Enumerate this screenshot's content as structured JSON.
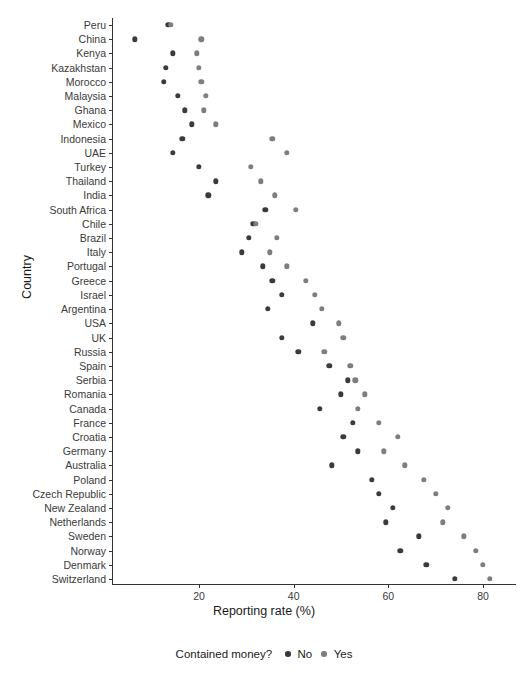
{
  "chart_data": {
    "type": "scatter",
    "title": "",
    "xlabel": "Reporting rate (%)",
    "ylabel": "Country",
    "xlim": [
      5,
      85
    ],
    "xticks": [
      20,
      40,
      60,
      80
    ],
    "xticklabels": [
      "20",
      "40",
      "60",
      "80"
    ],
    "grid": false,
    "legend": {
      "title": "Contained money?",
      "position": "bottom",
      "entries": [
        {
          "label": "No",
          "color": "#3b3b3b"
        },
        {
          "label": "Yes",
          "color": "#7e7e7e"
        }
      ]
    },
    "categories": [
      "Peru",
      "China",
      "Kenya",
      "Kazakhstan",
      "Morocco",
      "Malaysia",
      "Ghana",
      "Mexico",
      "Indonesia",
      "UAE",
      "Turkey",
      "Thailand",
      "India",
      "South Africa",
      "Chile",
      "Brazil",
      "Italy",
      "Portugal",
      "Greece",
      "Israel",
      "Argentina",
      "USA",
      "UK",
      "Russia",
      "Spain",
      "Serbia",
      "Romania",
      "Canada",
      "France",
      "Croatia",
      "Germany",
      "Australia",
      "Poland",
      "Czech Republic",
      "New Zealand",
      "Netherlands",
      "Sweden",
      "Norway",
      "Denmark",
      "Switzerland"
    ],
    "series": [
      {
        "name": "No",
        "color": "#3b3b3b",
        "values": [
          13.5,
          6.5,
          14.5,
          13.0,
          12.5,
          15.5,
          17.0,
          18.5,
          16.5,
          14.5,
          20.0,
          23.5,
          22.0,
          34.0,
          31.5,
          30.5,
          29.0,
          33.5,
          35.5,
          37.5,
          34.5,
          44.0,
          37.5,
          41.0,
          47.5,
          51.5,
          50.0,
          45.5,
          52.5,
          50.5,
          53.5,
          48.0,
          56.5,
          58.0,
          61.0,
          59.5,
          66.5,
          62.5,
          68.0,
          74.0
        ]
      },
      {
        "name": "Yes",
        "color": "#7e7e7e",
        "values": [
          14.0,
          20.5,
          19.5,
          20.0,
          20.5,
          21.5,
          21.0,
          23.5,
          35.5,
          38.5,
          31.0,
          33.0,
          36.0,
          40.5,
          32.0,
          36.5,
          35.0,
          38.5,
          42.5,
          44.5,
          46.0,
          49.5,
          50.5,
          46.5,
          52.0,
          53.0,
          55.0,
          53.5,
          58.0,
          62.0,
          59.0,
          63.5,
          67.5,
          70.0,
          72.5,
          71.5,
          76.0,
          78.5,
          80.0,
          81.5
        ]
      }
    ]
  }
}
